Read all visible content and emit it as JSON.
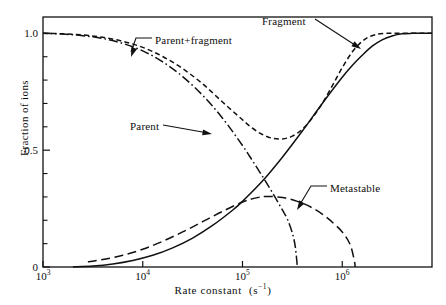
{
  "chart_data": {
    "type": "line",
    "title": "",
    "xlabel": "Rate constant  (s⁻¹)",
    "ylabel": "Fraction of ions",
    "xscale": "log",
    "xlim": [
      1000,
      7943282
    ],
    "ylim": [
      0,
      1.07
    ],
    "grid": false,
    "legend_position": "inline-annotations",
    "xticks": [
      {
        "value": 1000,
        "label": "10",
        "exponent": "3"
      },
      {
        "value": 10000,
        "label": "10",
        "exponent": "4"
      },
      {
        "value": 100000,
        "label": "10",
        "exponent": "5"
      },
      {
        "value": 1000000,
        "label": "10",
        "exponent": "6"
      }
    ],
    "yticks": [
      {
        "value": 0,
        "label": "0"
      },
      {
        "value": 0.5,
        "label": "0.5"
      },
      {
        "value": 1.0,
        "label": "1.0"
      }
    ],
    "yminor": [
      0.1,
      0.2,
      0.3,
      0.4,
      0.6,
      0.7,
      0.8,
      0.9
    ],
    "series": [
      {
        "name": "Parent + fragment",
        "style": "short-dashed",
        "points": [
          [
            3.0,
            1.0
          ],
          [
            3.2,
            0.998
          ],
          [
            3.4,
            0.993
          ],
          [
            3.6,
            0.983
          ],
          [
            3.8,
            0.966
          ],
          [
            4.0,
            0.94
          ],
          [
            4.2,
            0.901
          ],
          [
            4.4,
            0.849
          ],
          [
            4.6,
            0.784
          ],
          [
            4.8,
            0.706
          ],
          [
            5.0,
            0.63
          ],
          [
            5.1,
            0.594
          ],
          [
            5.2,
            0.567
          ],
          [
            5.3,
            0.551
          ],
          [
            5.4,
            0.548
          ],
          [
            5.5,
            0.56
          ],
          [
            5.6,
            0.59
          ],
          [
            5.7,
            0.638
          ],
          [
            5.8,
            0.7
          ],
          [
            5.9,
            0.775
          ],
          [
            6.0,
            0.853
          ],
          [
            6.1,
            0.92
          ],
          [
            6.2,
            0.966
          ],
          [
            6.3,
            0.99
          ],
          [
            6.45,
            1.0
          ],
          [
            6.9,
            1.0
          ]
        ]
      },
      {
        "name": "Parent",
        "style": "dash-dot",
        "points": [
          [
            3.0,
            1.0
          ],
          [
            3.2,
            0.997
          ],
          [
            3.4,
            0.99
          ],
          [
            3.6,
            0.978
          ],
          [
            3.8,
            0.957
          ],
          [
            4.0,
            0.925
          ],
          [
            4.2,
            0.878
          ],
          [
            4.4,
            0.815
          ],
          [
            4.6,
            0.735
          ],
          [
            4.8,
            0.637
          ],
          [
            5.0,
            0.52
          ],
          [
            5.1,
            0.455
          ],
          [
            5.2,
            0.388
          ],
          [
            5.3,
            0.318
          ],
          [
            5.4,
            0.244
          ],
          [
            5.45,
            0.205
          ],
          [
            5.5,
            0.145
          ],
          [
            5.53,
            0.085
          ],
          [
            5.55,
            0.0
          ]
        ]
      },
      {
        "name": "Fragment",
        "style": "solid",
        "points": [
          [
            3.3,
            0.0
          ],
          [
            3.5,
            0.004
          ],
          [
            3.7,
            0.013
          ],
          [
            3.9,
            0.028
          ],
          [
            4.1,
            0.05
          ],
          [
            4.3,
            0.082
          ],
          [
            4.5,
            0.124
          ],
          [
            4.7,
            0.178
          ],
          [
            4.9,
            0.243
          ],
          [
            5.0,
            0.281
          ],
          [
            5.2,
            0.368
          ],
          [
            5.4,
            0.47
          ],
          [
            5.6,
            0.582
          ],
          [
            5.8,
            0.7
          ],
          [
            6.0,
            0.812
          ],
          [
            6.1,
            0.862
          ],
          [
            6.2,
            0.906
          ],
          [
            6.3,
            0.945
          ],
          [
            6.4,
            0.972
          ],
          [
            6.5,
            0.989
          ],
          [
            6.6,
            0.998
          ],
          [
            6.7,
            1.0
          ],
          [
            6.9,
            1.0
          ]
        ]
      },
      {
        "name": "Metastable",
        "style": "long-dashed",
        "points": [
          [
            3.45,
            0.022
          ],
          [
            3.6,
            0.032
          ],
          [
            3.8,
            0.05
          ],
          [
            4.0,
            0.076
          ],
          [
            4.2,
            0.11
          ],
          [
            4.4,
            0.15
          ],
          [
            4.6,
            0.194
          ],
          [
            4.8,
            0.238
          ],
          [
            5.0,
            0.278
          ],
          [
            5.15,
            0.297
          ],
          [
            5.25,
            0.302
          ],
          [
            5.4,
            0.297
          ],
          [
            5.55,
            0.281
          ],
          [
            5.7,
            0.253
          ],
          [
            5.85,
            0.21
          ],
          [
            6.0,
            0.15
          ],
          [
            6.08,
            0.095
          ],
          [
            6.12,
            0.03
          ],
          [
            6.13,
            0.0
          ]
        ]
      }
    ],
    "annotations": [
      {
        "name": "parent-fragment-label",
        "text": "Parent+fragment",
        "text_x": 155,
        "text_y": 41,
        "leader": "M 152 38 L 136 38 L 131 52",
        "arrow_x": 131,
        "arrow_y": 57,
        "arrow_angle": 110
      },
      {
        "name": "fragment-label",
        "text": "Fragment",
        "text_x": 262,
        "text_y": 22,
        "leader": "M 315 19 L 358 47",
        "arrow_x": 361,
        "arrow_y": 49,
        "arrow_angle": 33
      },
      {
        "name": "parent-label",
        "text": "Parent",
        "text_x": 130,
        "text_y": 127,
        "leader": "M 163 125 L 208 133",
        "arrow_x": 212,
        "arrow_y": 134,
        "arrow_angle": 10
      },
      {
        "name": "metastable-label",
        "text": "Metastable",
        "text_x": 330,
        "text_y": 189,
        "leader": "M 327 186 L 311 186 L 299 206",
        "arrow_x": 297,
        "arrow_y": 210,
        "arrow_angle": 121
      }
    ]
  }
}
